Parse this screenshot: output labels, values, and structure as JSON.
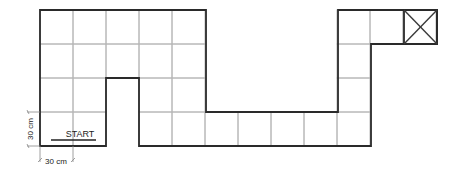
{
  "diagram": {
    "type": "grid-path",
    "start_label": "START",
    "cell_width_label": "30 cm",
    "cell_height_label": "30 cm",
    "goal_marker": "x-box",
    "cell_px": 33,
    "origin": [
      40,
      10
    ],
    "cells": [
      [
        0,
        0
      ],
      [
        1,
        0
      ],
      [
        2,
        0
      ],
      [
        3,
        0
      ],
      [
        4,
        0
      ],
      [
        0,
        1
      ],
      [
        1,
        1
      ],
      [
        2,
        1
      ],
      [
        3,
        1
      ],
      [
        4,
        1
      ],
      [
        0,
        2
      ],
      [
        1,
        2
      ],
      [
        3,
        2
      ],
      [
        4,
        2
      ],
      [
        0,
        3
      ],
      [
        1,
        3
      ],
      [
        3,
        3
      ],
      [
        4,
        3
      ],
      [
        5,
        3
      ],
      [
        6,
        3
      ],
      [
        7,
        3
      ],
      [
        8,
        3
      ],
      [
        9,
        3
      ],
      [
        9,
        2
      ],
      [
        9,
        1
      ],
      [
        9,
        0
      ],
      [
        10,
        0
      ],
      [
        11,
        0
      ]
    ],
    "goal_cell": [
      11,
      0
    ],
    "colors": {
      "outline": "#2a2a2a",
      "grid": "#b8b8b8",
      "background": "#ffffff"
    }
  }
}
